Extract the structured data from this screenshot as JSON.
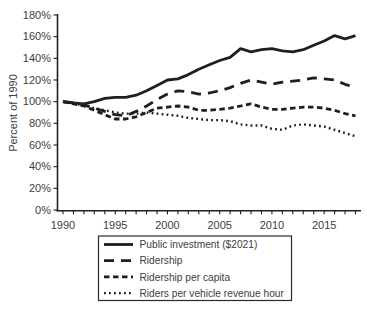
{
  "chart_data": {
    "type": "line",
    "title": "",
    "ylabel": "Percent of 1990",
    "xlabel": "",
    "x": [
      1990,
      1991,
      1992,
      1993,
      1994,
      1995,
      1996,
      1997,
      1998,
      1999,
      2000,
      2001,
      2002,
      2003,
      2004,
      2005,
      2006,
      2007,
      2008,
      2009,
      2010,
      2011,
      2012,
      2013,
      2014,
      2015,
      2016,
      2017,
      2018
    ],
    "x_tick_label_years": [
      1990,
      1995,
      2000,
      2005,
      2010,
      2015
    ],
    "ylim": [
      0,
      180
    ],
    "y_tick_step": 20,
    "y_tick_suffix": "%",
    "grid": false,
    "legend_position": "bottom-center",
    "colors": {
      "line": "#1f1f1f",
      "axis": "#1f1f1f",
      "text": "#3d3d3d",
      "background": "#ffffff",
      "legend_border": "#2a2a2a"
    },
    "series": [
      {
        "name": "Public investment ($2021)",
        "style": "solid",
        "values": [
          100,
          99,
          98,
          100,
          103,
          104,
          104,
          106,
          110,
          115,
          120,
          121,
          125,
          130,
          134,
          138,
          141,
          149,
          146,
          148,
          149,
          147,
          146,
          148,
          152,
          156,
          161,
          158,
          161
        ]
      },
      {
        "name": "Ridership",
        "style": "long-dash",
        "values": [
          100,
          99,
          97,
          94,
          91,
          88,
          87,
          91,
          96,
          102,
          107,
          110,
          109,
          107,
          108,
          110,
          113,
          117,
          120,
          118,
          116,
          118,
          119,
          120,
          122,
          121,
          120,
          116,
          113
        ]
      },
      {
        "name": "Ridership per capita",
        "style": "short-dash",
        "values": [
          100,
          98,
          96,
          92,
          88,
          84,
          84,
          86,
          90,
          94,
          95,
          96,
          95,
          92,
          92,
          93,
          94,
          96,
          98,
          95,
          93,
          93,
          94,
          95,
          95,
          94,
          92,
          89,
          87
        ]
      },
      {
        "name": "Riders per vehicle revenue hour",
        "style": "dotted",
        "values": [
          100,
          98,
          97,
          94,
          92,
          90,
          89,
          89,
          90,
          89,
          88,
          87,
          85,
          84,
          83,
          83,
          82,
          79,
          78,
          78,
          75,
          74,
          78,
          79,
          78,
          77,
          74,
          71,
          68
        ]
      }
    ]
  }
}
